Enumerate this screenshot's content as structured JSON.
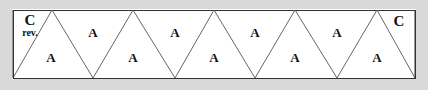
{
  "figure": {
    "name": "triangle-strip-diagram",
    "width": 428,
    "height": 90,
    "background_color": "#ffffff",
    "frame_color": "#d9d9d9",
    "line_color": "#555555",
    "border_color": "#333333",
    "text_color": "#111111"
  },
  "border_rect": {
    "x": 13,
    "y": 10,
    "width": 402,
    "height": 68
  },
  "zigzag": {
    "top_y": 10,
    "bottom_y": 78,
    "top_apex_x": [
      52,
      133,
      214,
      295,
      377
    ],
    "bottom_vertex_x": [
      13,
      93,
      175,
      255,
      337,
      415
    ]
  },
  "labels": {
    "corner_left": {
      "letter": "C",
      "sub": "rev.",
      "letter_x": 30,
      "letter_y": 20,
      "sub_x": 30,
      "sub_y": 33
    },
    "corner_right": {
      "letter": "C",
      "x": 399,
      "y": 21
    },
    "upper_row": [
      {
        "text": "A",
        "x": 93,
        "y": 32
      },
      {
        "text": "A",
        "x": 175,
        "y": 32
      },
      {
        "text": "A",
        "x": 255,
        "y": 32
      },
      {
        "text": "A",
        "x": 337,
        "y": 32
      },
      {
        "text": "A",
        "x": 180,
        "y": -100
      }
    ],
    "lower_row": [
      {
        "text": "A",
        "x": 51,
        "y": 57
      },
      {
        "text": "A",
        "x": 133,
        "y": 57
      },
      {
        "text": "A",
        "x": 214,
        "y": 57
      },
      {
        "text": "A",
        "x": 295,
        "y": 57
      },
      {
        "text": "A",
        "x": 377,
        "y": 57
      }
    ]
  }
}
